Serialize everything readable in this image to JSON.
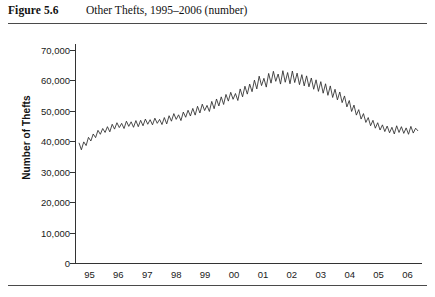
{
  "figure": {
    "number": "Figure 5.6",
    "caption": "Other Thefts, 1995–2006 (number)"
  },
  "chart_data": {
    "type": "line",
    "title": "Other Thefts, 1995–2006 (number)",
    "xlabel": "",
    "ylabel": "Number of Thefts",
    "grid": false,
    "legend": null,
    "ylim": [
      0,
      70000
    ],
    "yticks": [
      0,
      10000,
      20000,
      30000,
      40000,
      50000,
      60000,
      70000
    ],
    "ytick_labels": [
      "0",
      "10,000",
      "20,000",
      "30,000",
      "40,000",
      "50,000",
      "60,000",
      "70,000"
    ],
    "xlim": [
      1995,
      2007
    ],
    "xticks": [
      1995,
      1996,
      1997,
      1998,
      1999,
      2000,
      2001,
      2002,
      2003,
      2004,
      2005,
      2006
    ],
    "xtick_labels": [
      "95",
      "96",
      "97",
      "98",
      "99",
      "00",
      "01",
      "02",
      "03",
      "04",
      "05",
      "06"
    ],
    "frequency": "monthly",
    "line_color": "#2b2b2b",
    "series": [
      {
        "name": "Other Thefts",
        "values": [
          39500,
          37200,
          39800,
          38600,
          41300,
          40100,
          42400,
          41200,
          43600,
          42300,
          44200,
          42900,
          44800,
          43100,
          45600,
          44000,
          46100,
          44500,
          45900,
          44200,
          46600,
          44900,
          46400,
          44600,
          46800,
          44800,
          46900,
          45100,
          47300,
          45600,
          47100,
          45400,
          47600,
          45900,
          47200,
          45500,
          47800,
          45700,
          48400,
          46600,
          49100,
          47200,
          48700,
          46800,
          49600,
          47900,
          50200,
          48300,
          50800,
          48600,
          51500,
          49300,
          52200,
          50100,
          51800,
          49800,
          53100,
          50700,
          53900,
          51600,
          54600,
          52100,
          55400,
          53200,
          56100,
          53800,
          55700,
          53400,
          57200,
          54600,
          58100,
          55500,
          58800,
          56300,
          60100,
          57200,
          61400,
          58300,
          60700,
          57800,
          62300,
          59100,
          63000,
          59700,
          62100,
          58800,
          63200,
          59400,
          62600,
          58900,
          63100,
          59300,
          62400,
          58600,
          61900,
          58200,
          61500,
          57900,
          60800,
          57100,
          60200,
          56400,
          59600,
          55800,
          58900,
          55100,
          58200,
          54400,
          57100,
          53600,
          56200,
          52700,
          54900,
          51300,
          53400,
          49800,
          51900,
          48600,
          50400,
          47300,
          49100,
          46200,
          47800,
          45100,
          46900,
          44300,
          46100,
          43700,
          45400,
          43200,
          45000,
          42800,
          44600,
          42400,
          45100,
          42900,
          44800,
          42600,
          44400,
          42300,
          44900,
          42700,
          44300,
          43400
        ]
      }
    ],
    "summary": {
      "start_value": 39500,
      "peak_value": 63200,
      "peak_period": "2001–2002",
      "end_value": 43400
    }
  }
}
